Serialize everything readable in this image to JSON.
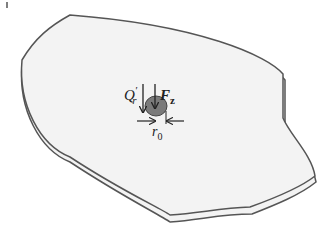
{
  "diagram": {
    "labels": {
      "shear_force": "Q",
      "shear_sub": "r",
      "shear_prime": "′",
      "axial_force": "F",
      "axial_sub": "z",
      "radius": "r",
      "radius_sub": "0"
    },
    "colors": {
      "plate_fill": "#f3f3f3",
      "plate_edge": "#555555",
      "load_patch": "#7a7a7a",
      "arrow": "#222222"
    }
  }
}
